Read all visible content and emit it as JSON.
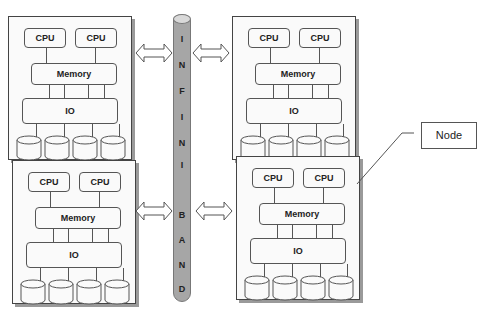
{
  "caption": "Figure 1 ...",
  "bus": {
    "name": "InfiniBand",
    "letters": [
      "I",
      "N",
      "F",
      "I",
      "N",
      "I",
      "B",
      "A",
      "N",
      "D"
    ],
    "color": "#a6a6a6"
  },
  "nodes": [
    {
      "id": "top-left",
      "cpus": [
        "CPU",
        "CPU"
      ],
      "memory": "Memory",
      "io": "IO",
      "disks": 4
    },
    {
      "id": "top-right",
      "cpus": [
        "CPU",
        "CPU"
      ],
      "memory": "Memory",
      "io": "IO",
      "disks": 4
    },
    {
      "id": "bottom-left",
      "cpus": [
        "CPU",
        "CPU"
      ],
      "memory": "Memory",
      "io": "IO",
      "disks": 4
    },
    {
      "id": "bottom-right",
      "cpus": [
        "CPU",
        "CPU"
      ],
      "memory": "Memory",
      "io": "IO",
      "disks": 4
    }
  ],
  "callout": {
    "label": "Node"
  }
}
